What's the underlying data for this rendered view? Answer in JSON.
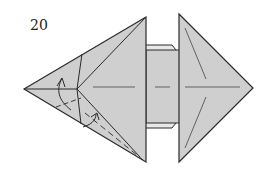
{
  "diagram": {
    "step_number": "20",
    "colors": {
      "paper": "#cfcfcf",
      "outline": "#2a2a2a",
      "crease": "#555555",
      "background": "#ffffff"
    }
  }
}
